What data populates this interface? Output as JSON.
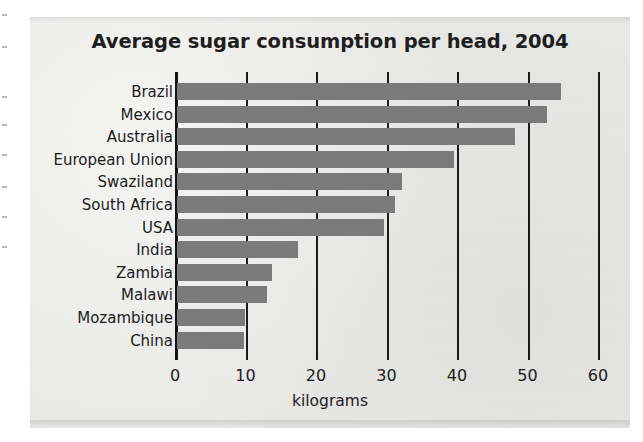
{
  "chart_data": {
    "type": "bar",
    "orientation": "horizontal",
    "title": "Average sugar consumption per head, 2004",
    "xlabel": "kilograms",
    "ylabel": "",
    "xlim": [
      0,
      60
    ],
    "xticks": [
      0,
      10,
      20,
      30,
      40,
      50,
      60
    ],
    "xtick_labels": [
      "0",
      "10",
      "20",
      "30",
      "40",
      "50",
      "60"
    ],
    "grid": true,
    "grid_axis": "x",
    "legend": false,
    "categories": [
      "Brazil",
      "Mexico",
      "Australia",
      "European Union",
      "Swaziland",
      "South Africa",
      "USA",
      "India",
      "Zambia",
      "Malawi",
      "Mozambique",
      "China"
    ],
    "values": [
      54.8,
      52.7,
      48.2,
      39.6,
      32.2,
      31.2,
      29.6,
      17.4,
      13.7,
      13.0,
      9.9,
      9.8
    ],
    "bar_color": "#7b7b7b",
    "axis_color": "#1b1b1b",
    "background_color": "#e9e9e7"
  },
  "figure": {
    "title": "Average sugar consumption per head, 2004",
    "axis_title": "kilograms"
  }
}
